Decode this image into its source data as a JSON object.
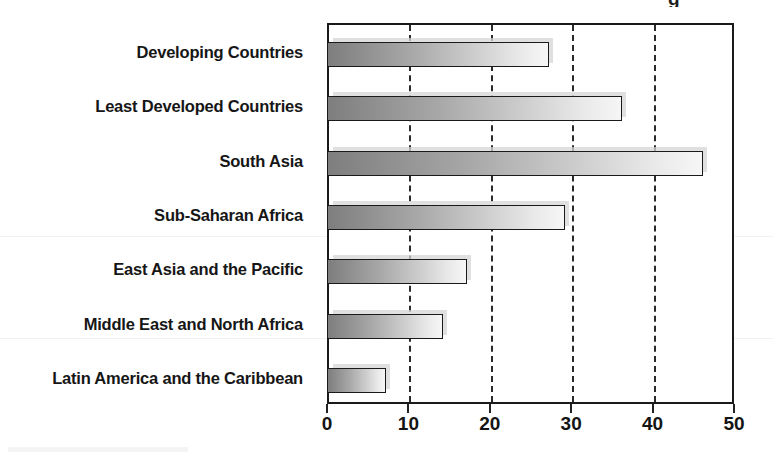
{
  "chart_data": {
    "type": "bar",
    "orientation": "horizontal",
    "title": "",
    "title_crop_glyph": "g",
    "xlabel": "",
    "ylabel": "",
    "categories": [
      "Developing Countries",
      "Least Developed Countries",
      "South Asia",
      "Sub-Saharan Africa",
      "East Asia and the Pacific",
      "Middle East and North Africa",
      "Latin America and the Caribbean"
    ],
    "values": [
      27,
      36,
      46,
      29,
      17,
      14,
      7
    ],
    "xlim": [
      0,
      50
    ],
    "xticks": [
      0,
      10,
      20,
      30,
      40,
      50
    ],
    "xtick_labels": [
      "0",
      "10",
      "20",
      "30",
      "40",
      "50"
    ],
    "gridlines": [
      10,
      20,
      30,
      40
    ],
    "grid": true,
    "grid_style": "dashed-vertical",
    "legend": null,
    "legend_position": "none",
    "series": [
      {
        "name": "",
        "values": [
          27,
          36,
          46,
          29,
          17,
          14,
          7
        ]
      }
    ],
    "colors": {
      "bar_gradient_start": "#7e7e7e",
      "bar_gradient_end": "#f6f6f6",
      "bar_border": "#1a1a1a",
      "bar_shadow": "#d6d6d6",
      "axis": "#1a1a1a",
      "gridline": "#2a2a2a",
      "label_text": "#161616",
      "background": "#ffffff"
    }
  }
}
